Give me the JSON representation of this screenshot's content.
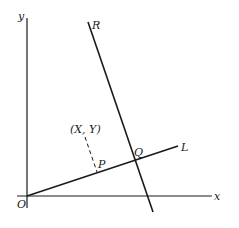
{
  "diagram": {
    "type": "geometry-coordinate-diagram",
    "colors": {
      "ink": "#1a1a1a",
      "background": "#ffffff"
    },
    "axes": {
      "x": {
        "label": "x",
        "from": [
          17,
          196
        ],
        "to": [
          212,
          196
        ]
      },
      "y": {
        "label": "y",
        "from": [
          27,
          208
        ],
        "to": [
          27,
          18
        ]
      }
    },
    "origin": {
      "label": "O",
      "point": [
        27,
        196
      ]
    },
    "lines": [
      {
        "id": "L",
        "label": "L",
        "from": [
          27,
          196
        ],
        "to": [
          178,
          146
        ],
        "style": "solid"
      },
      {
        "id": "R",
        "label": "R",
        "from": [
          88,
          22
        ],
        "to": [
          153,
          212
        ],
        "style": "solid"
      },
      {
        "id": "perpendicular",
        "label": "",
        "from": [
          85,
          137
        ],
        "to": [
          97,
          173
        ],
        "style": "dashed"
      }
    ],
    "points": [
      {
        "label": "P",
        "point": [
          97,
          173
        ]
      },
      {
        "label": "Q",
        "point": [
          135,
          160
        ]
      },
      {
        "label": "(X, Y)",
        "point": [
          85,
          137
        ]
      }
    ],
    "labels": {
      "x_axis": "x",
      "y_axis": "y",
      "origin": "O",
      "line_L": "L",
      "line_R": "R",
      "point_P": "P",
      "point_Q": "Q",
      "point_XY": "(X, Y)"
    }
  }
}
